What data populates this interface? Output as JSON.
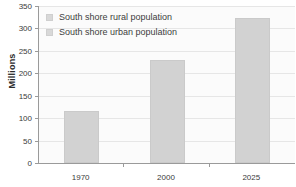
{
  "chart_data": {
    "type": "bar",
    "title": "",
    "xlabel": "",
    "ylabel": "Millions",
    "categories": [
      "1970",
      "2000",
      "2025"
    ],
    "values": [
      116,
      230,
      323
    ],
    "series": [
      {
        "name": "South shore urban population",
        "values": [
          116,
          230,
          323
        ]
      }
    ],
    "ylim": [
      0,
      350
    ],
    "yticks": [
      0,
      50,
      100,
      150,
      200,
      250,
      300,
      350
    ],
    "ytick_labels": [
      "0",
      "50",
      "100",
      "150",
      "200",
      "250",
      "300",
      "350"
    ],
    "grid": true,
    "legend_position": "top-left",
    "legend": [
      {
        "label": "South shore rural population",
        "color": "#d8d8d8"
      },
      {
        "label": "South shore urban population",
        "color": "#d8d8d8"
      }
    ],
    "bar_color": "#d2d2d2",
    "gridline_color": "#e6e6e6",
    "axis_color": "#9a9a9a",
    "plot_background": "#fbfbfb"
  }
}
